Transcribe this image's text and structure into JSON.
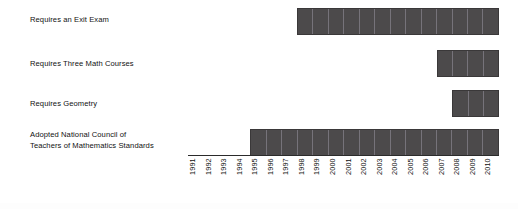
{
  "chart_data": {
    "type": "bar",
    "orientation": "horizontal",
    "title": "",
    "subtitle": "",
    "xlabel": "",
    "ylabel": "",
    "grid": false,
    "legend": null,
    "xlim": [
      1991,
      2010
    ],
    "x_tick_rotation": 90,
    "bar_fill_color": "#4c4a4b",
    "bar_border_color": "#3a3839",
    "cell_divider_color": "#76737a",
    "background_color": "#ffffff",
    "x": [
      "1991",
      "1992",
      "1993",
      "1994",
      "1995",
      "1996",
      "1997",
      "1998",
      "1999",
      "2000",
      "2001",
      "2002",
      "2003",
      "2004",
      "2005",
      "2006",
      "2007",
      "2008",
      "2009",
      "2010"
    ],
    "categories": [
      "Requires an Exit Exam",
      "Requires Three Math Courses",
      "Requires Geometry",
      "Adopted National Council of\nTeachers of Mathematics Standards"
    ],
    "series": [
      {
        "name": "Requires an Exit Exam",
        "start_year": 1998,
        "end_year": 2010,
        "span_years": 13
      },
      {
        "name": "Requires Three Math Courses",
        "start_year": 2007,
        "end_year": 2010,
        "span_years": 4
      },
      {
        "name": "Requires Geometry",
        "start_year": 2008,
        "end_year": 2010,
        "span_years": 3
      },
      {
        "name": "Adopted National Council of Teachers of Mathematics Standards",
        "start_year": 1995,
        "end_year": 2010,
        "span_years": 16
      }
    ]
  },
  "rows": [
    {
      "label": "Requires an Exit Exam"
    },
    {
      "label": "Requires Three Math Courses"
    },
    {
      "label": "Requires Geometry"
    },
    {
      "label": "Adopted National Council of\nTeachers of Mathematics Standards"
    }
  ]
}
